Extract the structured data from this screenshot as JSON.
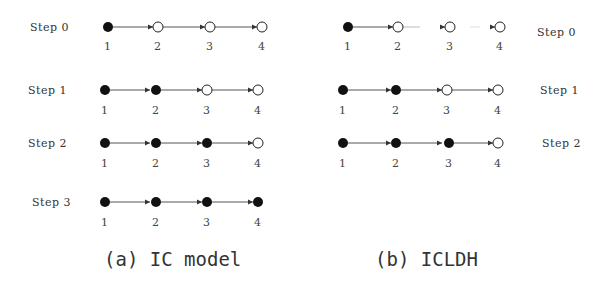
{
  "colors": {
    "active": "#111111",
    "inactive": "#ffffff",
    "edge": "#555555",
    "text": "#333333"
  },
  "panels": [
    {
      "id": "a",
      "caption": "(a) IC model",
      "steps": [
        {
          "label": "Step 0",
          "states": [
            "active",
            "inactive",
            "inactive",
            "inactive"
          ]
        },
        {
          "label": "Step 1",
          "states": [
            "active",
            "active",
            "inactive",
            "inactive"
          ]
        },
        {
          "label": "Step 2",
          "states": [
            "active",
            "active",
            "active",
            "inactive"
          ]
        },
        {
          "label": "Step 3",
          "states": [
            "active",
            "active",
            "active",
            "active"
          ]
        }
      ]
    },
    {
      "id": "b",
      "caption": "(b) ICLDH",
      "steps": [
        {
          "label": "Step 0",
          "states": [
            "active",
            "inactive",
            "inactive",
            "inactive"
          ]
        },
        {
          "label": "Step 1",
          "states": [
            "active",
            "active",
            "inactive",
            "inactive"
          ]
        },
        {
          "label": "Step 2",
          "states": [
            "active",
            "active",
            "active",
            "inactive"
          ]
        }
      ]
    }
  ],
  "node_labels": [
    "1",
    "2",
    "3",
    "4"
  ],
  "text": {
    "a_step0": "Step 0",
    "a_step1": "Step 1",
    "a_step2": "Step 2",
    "a_step3": "Step 3",
    "b_step0": "Step 0",
    "b_step1": "Step 1",
    "b_step2": "Step 2",
    "caption_a": "(a) IC model",
    "caption_b": "(b) ICLDH",
    "n1": "1",
    "n2": "2",
    "n3": "3",
    "n4": "4"
  }
}
